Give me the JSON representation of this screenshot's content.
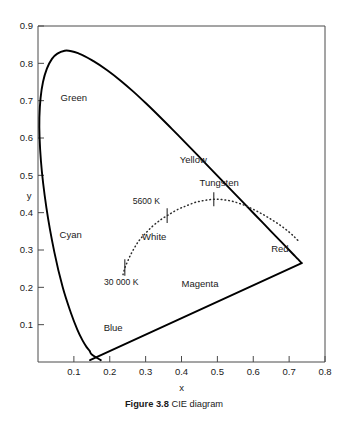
{
  "figure": {
    "caption_label": "Figure 3.8",
    "caption_text": "CIE diagram"
  },
  "chart_data": {
    "type": "line",
    "title": "CIE diagram",
    "xlabel": "x",
    "ylabel": "y",
    "xlim": [
      0.0,
      0.8
    ],
    "ylim": [
      0.0,
      0.9
    ],
    "grid": false,
    "legend": "none",
    "xticks": [
      0.1,
      0.2,
      0.3,
      0.4,
      0.5,
      0.6,
      0.7,
      0.8
    ],
    "xtick_labels": [
      "0.1",
      "0.2",
      "0.3",
      "0.4",
      "0.5",
      "0.6",
      "0.7",
      "0.8"
    ],
    "yticks": [
      0.1,
      0.2,
      0.3,
      0.4,
      0.5,
      0.6,
      0.7,
      0.8,
      0.9
    ],
    "ytick_labels": [
      "0.1",
      "0.2",
      "0.3",
      "0.4",
      "0.5",
      "0.6",
      "0.7",
      "0.8",
      "0.9"
    ],
    "series": [
      {
        "name": "spectral-locus",
        "style": "solid",
        "points": [
          [
            0.175,
            0.005
          ],
          [
            0.15,
            0.02
          ],
          [
            0.144,
            0.0297
          ],
          [
            0.1355,
            0.0399
          ],
          [
            0.1241,
            0.0578
          ],
          [
            0.1096,
            0.0868
          ],
          [
            0.0913,
            0.1327
          ],
          [
            0.0687,
            0.2007
          ],
          [
            0.0454,
            0.295
          ],
          [
            0.0235,
            0.4127
          ],
          [
            0.0082,
            0.5384
          ],
          [
            0.0039,
            0.6548
          ],
          [
            0.0139,
            0.7502
          ],
          [
            0.0389,
            0.812
          ],
          [
            0.0743,
            0.8338
          ],
          [
            0.1142,
            0.8262
          ],
          [
            0.1547,
            0.8059
          ],
          [
            0.1929,
            0.7816
          ],
          [
            0.2296,
            0.7543
          ],
          [
            0.2658,
            0.7243
          ],
          [
            0.3016,
            0.6923
          ],
          [
            0.3373,
            0.6589
          ],
          [
            0.3731,
            0.6245
          ],
          [
            0.4087,
            0.5896
          ],
          [
            0.4441,
            0.5547
          ],
          [
            0.4788,
            0.5202
          ],
          [
            0.5125,
            0.4866
          ],
          [
            0.5448,
            0.4544
          ],
          [
            0.5752,
            0.4242
          ],
          [
            0.6029,
            0.3965
          ],
          [
            0.627,
            0.3725
          ],
          [
            0.6482,
            0.3514
          ],
          [
            0.6658,
            0.334
          ],
          [
            0.6801,
            0.3197
          ],
          [
            0.6915,
            0.3083
          ],
          [
            0.7006,
            0.2993
          ],
          [
            0.7079,
            0.292
          ],
          [
            0.714,
            0.2859
          ],
          [
            0.719,
            0.2809
          ],
          [
            0.723,
            0.277
          ],
          [
            0.726,
            0.274
          ],
          [
            0.735,
            0.265
          ]
        ]
      },
      {
        "name": "purple-line",
        "style": "solid",
        "points": [
          [
            0.735,
            0.265
          ],
          [
            0.145,
            0.005
          ]
        ]
      },
      {
        "name": "planckian-locus",
        "style": "dotted",
        "points": [
          [
            0.237,
            0.234
          ],
          [
            0.24,
            0.245
          ],
          [
            0.244,
            0.257
          ],
          [
            0.25,
            0.27
          ],
          [
            0.256,
            0.283
          ],
          [
            0.263,
            0.296
          ],
          [
            0.272,
            0.311
          ],
          [
            0.28,
            0.323
          ],
          [
            0.29,
            0.335
          ],
          [
            0.3,
            0.345
          ],
          [
            0.31,
            0.355
          ],
          [
            0.322,
            0.366
          ],
          [
            0.335,
            0.376
          ],
          [
            0.345,
            0.383
          ],
          [
            0.36,
            0.392
          ],
          [
            0.372,
            0.399
          ],
          [
            0.39,
            0.409
          ],
          [
            0.405,
            0.415
          ],
          [
            0.42,
            0.421
          ],
          [
            0.44,
            0.428
          ],
          [
            0.46,
            0.432
          ],
          [
            0.48,
            0.435
          ],
          [
            0.5,
            0.436
          ],
          [
            0.52,
            0.434
          ],
          [
            0.54,
            0.431
          ],
          [
            0.56,
            0.425
          ],
          [
            0.58,
            0.418
          ],
          [
            0.6,
            0.409
          ],
          [
            0.62,
            0.399
          ],
          [
            0.64,
            0.388
          ],
          [
            0.66,
            0.376
          ],
          [
            0.68,
            0.363
          ],
          [
            0.7,
            0.348
          ],
          [
            0.715,
            0.335
          ],
          [
            0.728,
            0.322
          ]
        ]
      }
    ],
    "locus_ticks": [
      {
        "name": "tick-30000K",
        "x": 0.242,
        "y": 0.253,
        "half_height": 0.022
      },
      {
        "name": "tick-5600K",
        "x": 0.36,
        "y": 0.392,
        "half_height": 0.02
      },
      {
        "name": "tick-tungsten",
        "x": 0.49,
        "y": 0.436,
        "half_height": 0.019
      }
    ],
    "annotations": [
      {
        "name": "label-green",
        "text": "Green",
        "x": 0.063,
        "y": 0.7,
        "anchor": "start"
      },
      {
        "name": "label-cyan",
        "text": "Cyan",
        "x": 0.06,
        "y": 0.333,
        "anchor": "start"
      },
      {
        "name": "label-blue",
        "text": "Blue",
        "x": 0.183,
        "y": 0.083,
        "anchor": "start"
      },
      {
        "name": "label-yellow",
        "text": "Yellow",
        "x": 0.395,
        "y": 0.533,
        "anchor": "start"
      },
      {
        "name": "label-magenta",
        "text": "Magenta",
        "x": 0.4,
        "y": 0.202,
        "anchor": "start"
      },
      {
        "name": "label-red",
        "text": "Red",
        "x": 0.65,
        "y": 0.295,
        "anchor": "start"
      },
      {
        "name": "label-white",
        "text": "White",
        "x": 0.29,
        "y": 0.327,
        "anchor": "start"
      },
      {
        "name": "label-tungsten",
        "text": "Tungsten",
        "x": 0.45,
        "y": 0.472,
        "anchor": "start"
      },
      {
        "name": "label-5600k",
        "text": "5600 K",
        "x": 0.34,
        "y": 0.424,
        "anchor": "end"
      },
      {
        "name": "label-30000k",
        "text": "30 000 K",
        "x": 0.232,
        "y": 0.205,
        "anchor": "middle"
      }
    ]
  }
}
